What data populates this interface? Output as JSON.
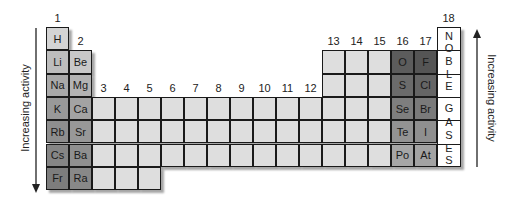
{
  "diagram": {
    "left_axis_label": "Increasing activity",
    "right_axis_label": "Increasing activity",
    "left_arrow_direction": "down",
    "right_arrow_direction": "up",
    "group_labels": [
      "1",
      "2",
      "3",
      "4",
      "5",
      "6",
      "7",
      "8",
      "9",
      "10",
      "11",
      "12",
      "13",
      "14",
      "15",
      "16",
      "17",
      "18"
    ],
    "noble_gases_letters": [
      "N",
      "O",
      "B",
      "L",
      "E",
      "G",
      "A",
      "S",
      "E",
      "S"
    ],
    "noble_gases_label": "NOBLE GASES",
    "elements": [
      {
        "symbol": "H",
        "group": 1,
        "period": 1,
        "color": "#d4d4d4"
      },
      {
        "symbol": "Li",
        "group": 1,
        "period": 2,
        "color": "#bdbdbd"
      },
      {
        "symbol": "Na",
        "group": 1,
        "period": 3,
        "color": "#a9a9a9"
      },
      {
        "symbol": "K",
        "group": 1,
        "period": 4,
        "color": "#999999"
      },
      {
        "symbol": "Rb",
        "group": 1,
        "period": 5,
        "color": "#8e8e8e"
      },
      {
        "symbol": "Cs",
        "group": 1,
        "period": 6,
        "color": "#858585"
      },
      {
        "symbol": "Fr",
        "group": 1,
        "period": 7,
        "color": "#7d7d7d"
      },
      {
        "symbol": "Be",
        "group": 2,
        "period": 2,
        "color": "#c8c8c8"
      },
      {
        "symbol": "Mg",
        "group": 2,
        "period": 3,
        "color": "#b3b3b3"
      },
      {
        "symbol": "Ca",
        "group": 2,
        "period": 4,
        "color": "#a3a3a3"
      },
      {
        "symbol": "Sr",
        "group": 2,
        "period": 5,
        "color": "#989898"
      },
      {
        "symbol": "Ba",
        "group": 2,
        "period": 6,
        "color": "#8f8f8f"
      },
      {
        "symbol": "Ra",
        "group": 2,
        "period": 7,
        "color": "#888888"
      },
      {
        "symbol": "O",
        "group": 16,
        "period": 2,
        "color": "#5c5c5c"
      },
      {
        "symbol": "S",
        "group": 16,
        "period": 3,
        "color": "#6b6b6b"
      },
      {
        "symbol": "Se",
        "group": 16,
        "period": 4,
        "color": "#7e7e7e"
      },
      {
        "symbol": "Te",
        "group": 16,
        "period": 5,
        "color": "#939393"
      },
      {
        "symbol": "Po",
        "group": 16,
        "period": 6,
        "color": "#a6a6a6"
      },
      {
        "symbol": "F",
        "group": 17,
        "period": 2,
        "color": "#555555"
      },
      {
        "symbol": "Cl",
        "group": 17,
        "period": 3,
        "color": "#656565"
      },
      {
        "symbol": "Br",
        "group": 17,
        "period": 4,
        "color": "#7a7a7a"
      },
      {
        "symbol": "I",
        "group": 17,
        "period": 5,
        "color": "#8f8f8f"
      },
      {
        "symbol": "At",
        "group": 17,
        "period": 6,
        "color": "#a3a3a3"
      }
    ],
    "blank_cell_color": "#dedede"
  }
}
